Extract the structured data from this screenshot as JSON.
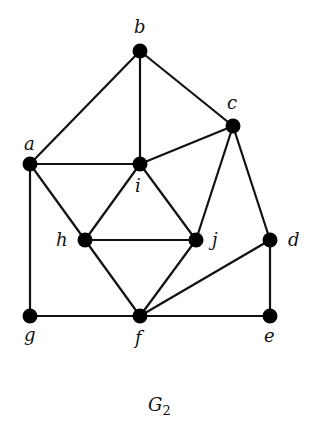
{
  "title": "G",
  "title_subscript": "2",
  "nodes": [
    {
      "id": "a",
      "x": 30,
      "y": 164,
      "lx": 24,
      "ly": 150
    },
    {
      "id": "b",
      "x": 140,
      "y": 51,
      "lx": 134,
      "ly": 33
    },
    {
      "id": "c",
      "x": 233,
      "y": 126,
      "lx": 227,
      "ly": 109
    },
    {
      "id": "d",
      "x": 270,
      "y": 240,
      "lx": 288,
      "ly": 246
    },
    {
      "id": "e",
      "x": 270,
      "y": 316,
      "lx": 264,
      "ly": 342
    },
    {
      "id": "f",
      "x": 140,
      "y": 316,
      "lx": 135,
      "ly": 344
    },
    {
      "id": "g",
      "x": 30,
      "y": 316,
      "lx": 24,
      "ly": 341
    },
    {
      "id": "h",
      "x": 85,
      "y": 240,
      "lx": 56,
      "ly": 246
    },
    {
      "id": "i",
      "x": 140,
      "y": 164,
      "lx": 135,
      "ly": 192
    },
    {
      "id": "j",
      "x": 196,
      "y": 240,
      "lx": 212,
      "ly": 246
    }
  ],
  "edges": [
    [
      "a",
      "b"
    ],
    [
      "b",
      "i"
    ],
    [
      "b",
      "c"
    ],
    [
      "a",
      "i"
    ],
    [
      "i",
      "c"
    ],
    [
      "a",
      "g"
    ],
    [
      "a",
      "h"
    ],
    [
      "i",
      "h"
    ],
    [
      "i",
      "j"
    ],
    [
      "h",
      "j"
    ],
    [
      "c",
      "j"
    ],
    [
      "c",
      "d"
    ],
    [
      "h",
      "f"
    ],
    [
      "j",
      "f"
    ],
    [
      "d",
      "f"
    ],
    [
      "d",
      "e"
    ],
    [
      "g",
      "f"
    ],
    [
      "f",
      "e"
    ]
  ]
}
